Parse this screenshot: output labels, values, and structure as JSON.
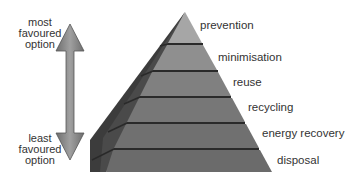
{
  "diagram": {
    "type": "waste-hierarchy-pyramid",
    "axis": {
      "top_label": [
        "most",
        "favoured",
        "option"
      ],
      "bottom_label": [
        "least",
        "favoured",
        "option"
      ],
      "arrow": "double-headed-vertical"
    },
    "layers": [
      {
        "label": "prevention",
        "color": "#a6a6a6"
      },
      {
        "label": "minimisation",
        "color": "#8d8d8d"
      },
      {
        "label": "reuse",
        "color": "#7f7f7f"
      },
      {
        "label": "recycling",
        "color": "#767676"
      },
      {
        "label": "energy recovery",
        "color": "#6f6f6f"
      },
      {
        "label": "disposal",
        "color": "#6a6a6a"
      }
    ],
    "colors": {
      "side_face": "#3f3f3f",
      "separator": "#2a2a2a",
      "arrow_light": "#9a9a9a",
      "arrow_dark": "#6a6a6a"
    }
  }
}
